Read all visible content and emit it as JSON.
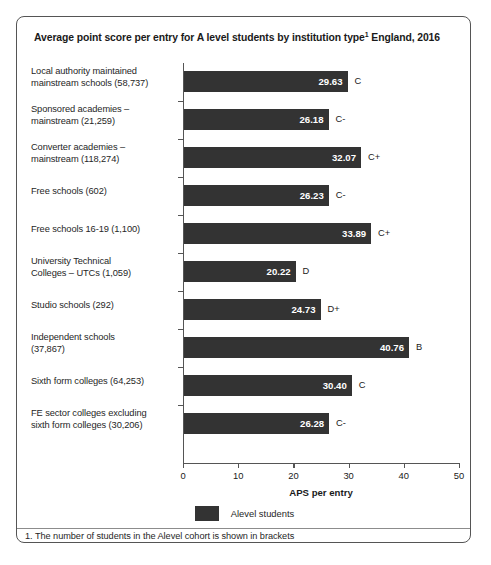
{
  "panel": {
    "title_main": "Average point score per entry for A level students by institution type",
    "title_sup": "1",
    "title_tail": " England, 2016"
  },
  "chart_data": {
    "type": "bar",
    "orientation": "horizontal",
    "title": "Average point score per entry for A level students by institution type1 England, 2016",
    "xlabel": "APS per entry",
    "ylabel": "",
    "xlim": [
      0,
      50
    ],
    "xticks": [
      0,
      10,
      20,
      30,
      40,
      50
    ],
    "grid": false,
    "legend_position": "bottom-center",
    "series": [
      {
        "name": "Alevel students",
        "color": "#333333",
        "values": [
          29.63,
          26.18,
          32.07,
          26.23,
          33.89,
          20.22,
          24.73,
          40.76,
          30.4,
          26.28
        ]
      }
    ],
    "categories": [
      "Local authority maintained mainstream schools (58,737)",
      "Sponsored academies – mainstream (21,259)",
      "Converter academies – mainstream (118,274)",
      "Free schools (602)",
      "Free schools 16-19 (1,100)",
      "University Technical Colleges – UTCs (1,059)",
      "Studio schools (292)",
      "Independent schools (37,867)",
      "Sixth form colleges (64,253)",
      "FE sector colleges excluding sixth form colleges (30,206)"
    ],
    "point_annotations": [
      "C",
      "C-",
      "C+",
      "C-",
      "C+",
      "D",
      "D+",
      "B",
      "C",
      "C-"
    ]
  },
  "rows": [
    {
      "label_line1": "Local authority maintained",
      "label_line2": "mainstream schools (58,737)",
      "value": "29.63",
      "grade": "C",
      "num": 29.63
    },
    {
      "label_line1": "Sponsored academies –",
      "label_line2": "mainstream (21,259)",
      "value": "26.18",
      "grade": "C-",
      "num": 26.18
    },
    {
      "label_line1": "Converter academies –",
      "label_line2": "mainstream (118,274)",
      "value": "32.07",
      "grade": "C+",
      "num": 32.07
    },
    {
      "label_line1": "Free schools (602)",
      "label_line2": "",
      "value": "26.23",
      "grade": "C-",
      "num": 26.23
    },
    {
      "label_line1": "Free schools 16-19 (1,100)",
      "label_line2": "",
      "value": "33.89",
      "grade": "C+",
      "num": 33.89
    },
    {
      "label_line1": "University Technical",
      "label_line2": "Colleges – UTCs (1,059)",
      "value": "20.22",
      "grade": "D",
      "num": 20.22
    },
    {
      "label_line1": "Studio schools (292)",
      "label_line2": "",
      "value": "24.73",
      "grade": "D+",
      "num": 24.73
    },
    {
      "label_line1": "Independent schools",
      "label_line2": "(37,867)",
      "value": "40.76",
      "grade": "B",
      "num": 40.76
    },
    {
      "label_line1": "Sixth form colleges (64,253)",
      "label_line2": "",
      "value": "30.40",
      "grade": "C",
      "num": 30.4
    },
    {
      "label_line1": "FE sector colleges excluding",
      "label_line2": "sixth form colleges (30,206)",
      "value": "26.28",
      "grade": "C-",
      "num": 26.28
    }
  ],
  "axis": {
    "ticks": [
      "0",
      "10",
      "20",
      "30",
      "40",
      "50"
    ],
    "title": "APS per entry"
  },
  "legend": {
    "label": "Alevel students",
    "color": "#333333"
  },
  "footnote": {
    "text": "1. The number of students in the Alevel cohort is shown in brackets"
  },
  "source": {
    "text": ""
  }
}
